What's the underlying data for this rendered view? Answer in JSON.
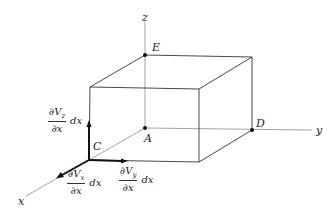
{
  "diagram": {
    "axes": {
      "x_label": "x",
      "y_label": "y",
      "z_label": "z"
    },
    "points": {
      "A": "A",
      "C": "C",
      "D": "D",
      "E": "E"
    },
    "vectors": {
      "vz": {
        "numerator": "∂V",
        "subscript": "z",
        "denominator": "∂x",
        "suffix": "dx"
      },
      "vx": {
        "numerator": "∂V",
        "subscript": "x",
        "denominator": "∂x",
        "suffix": "dx"
      },
      "vy": {
        "numerator": "∂V",
        "subscript": "y",
        "denominator": "∂x",
        "suffix": "dx"
      }
    },
    "colors": {
      "line": "#333333",
      "axis": "#555555",
      "background": "#ffffff"
    }
  }
}
